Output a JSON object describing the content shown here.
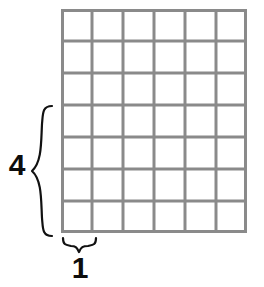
{
  "figure": {
    "type": "rectangular-area-grid",
    "background_color": "#ffffff",
    "grid": {
      "columns": 6,
      "rows": 7,
      "cell_width_px": 31,
      "cell_height_px": 32,
      "line_color": "#8a8a8a",
      "line_width_px": 3,
      "cell_fill": "#ffffff",
      "left_px": 61,
      "top_px": 9,
      "width_px": 186,
      "height_px": 224
    },
    "dimensions": [
      {
        "name": "height-dimension",
        "label": "4",
        "orientation": "vertical",
        "spans_units": 4,
        "brace_color": "#111111",
        "label_color": "#0d0d0d"
      },
      {
        "name": "width-dimension",
        "label": "1",
        "orientation": "horizontal",
        "spans_units": 1,
        "brace_color": "#111111",
        "label_color": "#0d0d0d"
      }
    ]
  },
  "chart_data": {
    "type": "table",
    "title": "",
    "xlabel": "",
    "ylabel": "",
    "categories": [
      "width",
      "height"
    ],
    "values": [
      1,
      4
    ],
    "grid": true,
    "annotations": [
      "1",
      "4"
    ]
  }
}
